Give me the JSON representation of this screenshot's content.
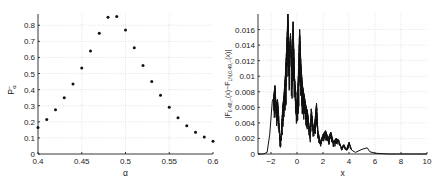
{
  "chart_data": [
    {
      "type": "scatter",
      "title": "",
      "xlabel": "α",
      "ylabel": "P−_α",
      "xlim": [
        0.4,
        0.6
      ],
      "ylim": [
        0,
        0.87
      ],
      "grid": true,
      "legend": null,
      "xticks": [
        "0.4",
        "0.45",
        "0.5",
        "0.55",
        "0.6"
      ],
      "yticks": [
        "0",
        "0.1",
        "0.2",
        "0.3",
        "0.4",
        "0.5",
        "0.6",
        "0.7",
        "0.8"
      ],
      "x": [
        0.4,
        0.41,
        0.42,
        0.43,
        0.44,
        0.45,
        0.46,
        0.47,
        0.48,
        0.49,
        0.5,
        0.51,
        0.52,
        0.53,
        0.54,
        0.55,
        0.56,
        0.57,
        0.58,
        0.59,
        0.6
      ],
      "y": [
        0.165,
        0.215,
        0.275,
        0.35,
        0.435,
        0.535,
        0.64,
        0.75,
        0.85,
        0.855,
        0.77,
        0.66,
        0.55,
        0.45,
        0.365,
        0.29,
        0.225,
        0.175,
        0.135,
        0.105,
        0.08
      ]
    },
    {
      "type": "line",
      "title": "",
      "xlabel": "x",
      "ylabel": "|F_{0.48,−}(x) − F_{LN,0.49,−}(x)|",
      "xlim": [
        -3,
        10
      ],
      "ylim": [
        0,
        0.018
      ],
      "grid": true,
      "legend": null,
      "xticks": [
        "-2",
        "0",
        "2",
        "4",
        "6",
        "8",
        "10"
      ],
      "yticks": [
        "0",
        "0.002",
        "0.004",
        "0.006",
        "0.008",
        "0.01",
        "0.012",
        "0.014",
        "0.016"
      ],
      "x": [
        -3,
        -2.6,
        -2.3,
        -2.1,
        -1.9,
        -1.8,
        -1.7,
        -1.6,
        -1.5,
        -1.4,
        -1.3,
        -1.2,
        -1.1,
        -1.0,
        -0.9,
        -0.8,
        -0.7,
        -0.6,
        -0.5,
        -0.4,
        -0.3,
        -0.2,
        -0.1,
        0.0,
        0.1,
        0.2,
        0.3,
        0.4,
        0.5,
        0.6,
        0.7,
        0.8,
        0.9,
        1.0,
        1.1,
        1.2,
        1.3,
        1.4,
        1.5,
        1.6,
        1.8,
        2.0,
        2.2,
        2.4,
        2.6,
        2.8,
        3.0,
        3.2,
        3.4,
        3.6,
        3.8,
        4.0,
        4.2,
        4.5,
        5.0,
        5.4,
        5.6,
        6.0,
        7.0,
        8.0,
        10.0
      ],
      "y": [
        0,
        0,
        0.0002,
        0.0025,
        0.0068,
        0.0072,
        0.0088,
        0.006,
        0.007,
        0.0045,
        0.001,
        0.003,
        0.006,
        0.0075,
        0.01,
        0.0135,
        0.018,
        0.0125,
        0.0155,
        0.011,
        0.017,
        0.01,
        0.008,
        0.005,
        0.01,
        0.016,
        0.0115,
        0.009,
        0.008,
        0.007,
        0.006,
        0.0055,
        0.004,
        0.002,
        0.0058,
        0.004,
        0.003,
        0.0045,
        0.0065,
        0.003,
        0.0015,
        0.0025,
        0.003,
        0.002,
        0.0028,
        0.0015,
        0.002,
        0.0018,
        0.0008,
        0.0012,
        0.0005,
        0.0015,
        0.0005,
        0.0002,
        0.0006,
        0.0008,
        0.0003,
        0.0001,
        0,
        0,
        0
      ]
    }
  ]
}
